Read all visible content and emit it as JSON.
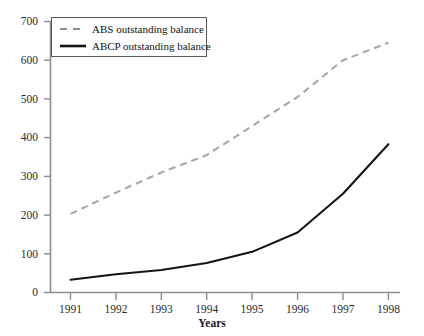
{
  "chart_data": {
    "type": "line",
    "title": "",
    "subtitle": "",
    "xlabel": "Years",
    "ylabel": "",
    "x": [
      1991,
      1992,
      1993,
      1994,
      1995,
      1996,
      1997,
      1998
    ],
    "categories": [
      "1991",
      "1992",
      "1993",
      "1994",
      "1995",
      "1996",
      "1997",
      "1998"
    ],
    "xlim": [
      1990.6,
      1998.6
    ],
    "ylim": [
      0,
      700
    ],
    "y_ticks": [
      0,
      100,
      200,
      300,
      400,
      500,
      600,
      700
    ],
    "y_tick_labels": [
      "0",
      "100",
      "200",
      "300",
      "400",
      "500",
      "600",
      "700"
    ],
    "x_tick_labels": [
      "1991",
      "1992",
      "1993",
      "1994",
      "1995",
      "1996",
      "1997",
      "1998"
    ],
    "grid": false,
    "legend_position": "top-left",
    "series": [
      {
        "name": "ABS outstanding balance",
        "style": "dashed",
        "color": "#a8a8a8",
        "width": 2,
        "values": [
          203,
          258,
          310,
          355,
          430,
          505,
          600,
          645
        ]
      },
      {
        "name": "ABCP outstanding balance",
        "style": "solid",
        "color": "#141414",
        "width": 2,
        "values": [
          33,
          47,
          58,
          76,
          105,
          155,
          255,
          383
        ]
      }
    ],
    "annotations": []
  },
  "legend": {
    "items": [
      {
        "label": "ABS outstanding balance",
        "swatch": "dashed-line-swatch"
      },
      {
        "label": "ABCP outstanding balance",
        "swatch": "solid-line-swatch"
      }
    ]
  },
  "axes": {
    "x_title": "Years",
    "y_labels": [
      "700",
      "600",
      "500",
      "400",
      "300",
      "200",
      "100",
      "0"
    ],
    "x_labels": [
      "1991",
      "1992",
      "1993",
      "1994",
      "1995",
      "1996",
      "1997",
      "1998"
    ],
    "axis_color": "#8e8e8e"
  }
}
